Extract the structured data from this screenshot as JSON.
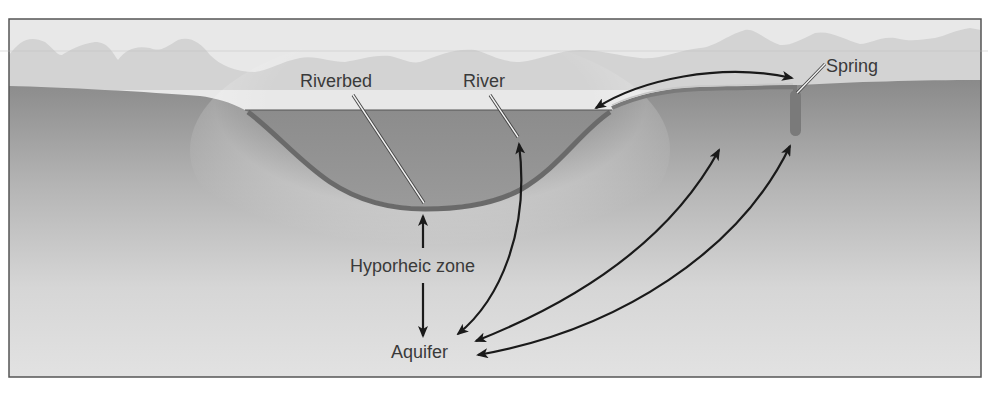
{
  "diagram": {
    "labels": {
      "riverbed": "Riverbed",
      "river": "River",
      "spring": "Spring",
      "hyporheic_zone": "Hyporheic zone",
      "aquifer": "Aquifer"
    },
    "flows": [
      {
        "from": "River",
        "to": "Spring",
        "direction": "bidirectional"
      },
      {
        "from": "Riverbed",
        "to": "Aquifer",
        "via": "Hyporheic zone",
        "direction": "bidirectional"
      },
      {
        "from": "Aquifer",
        "to": "River",
        "direction": "bidirectional"
      },
      {
        "from": "Aquifer",
        "to": "Ground (mid-slope)",
        "direction": "bidirectional"
      },
      {
        "from": "Aquifer",
        "to": "Spring",
        "direction": "bidirectional"
      }
    ],
    "colors": {
      "sky": "#e6e6e6",
      "hills": "#d2d2d2",
      "ground_top": "#8e8e8e",
      "ground_bottom": "#e0e0e0",
      "river_water": "#8a8a8a",
      "riverbed": "#6a6a6a",
      "arrow": "#1a1a1a",
      "frame": "#555555",
      "text": "#3a3a3a"
    }
  }
}
